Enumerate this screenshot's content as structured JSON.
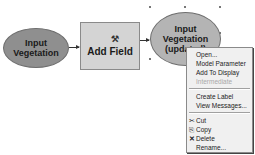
{
  "diagram": {
    "nodes": [
      {
        "id": "input",
        "shape": "ellipse",
        "label": "Input Vegetation",
        "fill": "#8f8f8f"
      },
      {
        "id": "tool",
        "shape": "rectangle",
        "label": "Add Field",
        "icon": "hammer-tool-icon",
        "fill": "#d4d4d4"
      },
      {
        "id": "output",
        "shape": "ellipse",
        "label": "Input Vegetation (updated)",
        "fill": "#b4b4b4",
        "selected": true
      }
    ],
    "edges": [
      {
        "from": "input",
        "to": "tool"
      },
      {
        "from": "tool",
        "to": "output"
      }
    ]
  },
  "context_menu": {
    "items": [
      {
        "label": "Open...",
        "enabled": true
      },
      {
        "label": "Model Parameter",
        "enabled": true
      },
      {
        "label": "Add To Display",
        "enabled": true
      },
      {
        "label": "Intermediate",
        "enabled": false
      },
      {
        "label": "Create Label",
        "enabled": true
      },
      {
        "label": "View Messages...",
        "enabled": true
      },
      {
        "label": "Cut",
        "enabled": true,
        "icon": "scissors-icon",
        "glyph": "✂"
      },
      {
        "label": "Copy",
        "enabled": true,
        "icon": "copy-icon",
        "glyph": "⎘"
      },
      {
        "label": "Delete",
        "enabled": true,
        "icon": "delete-x-icon",
        "glyph": "✕"
      },
      {
        "label": "Rename...",
        "enabled": true
      }
    ]
  }
}
